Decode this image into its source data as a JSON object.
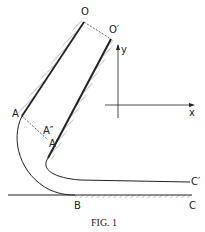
{
  "figure": {
    "caption": "FIG. 1",
    "labels": {
      "O": "O",
      "O_prime": "O′",
      "A": "A",
      "A_double_prime": "A″",
      "A_prime": "A′",
      "B": "B",
      "C": "C",
      "C_prime": "C′",
      "x_axis": "x",
      "y_axis": "y"
    },
    "colors": {
      "ink": "#222222",
      "background": "#ffffff"
    }
  }
}
